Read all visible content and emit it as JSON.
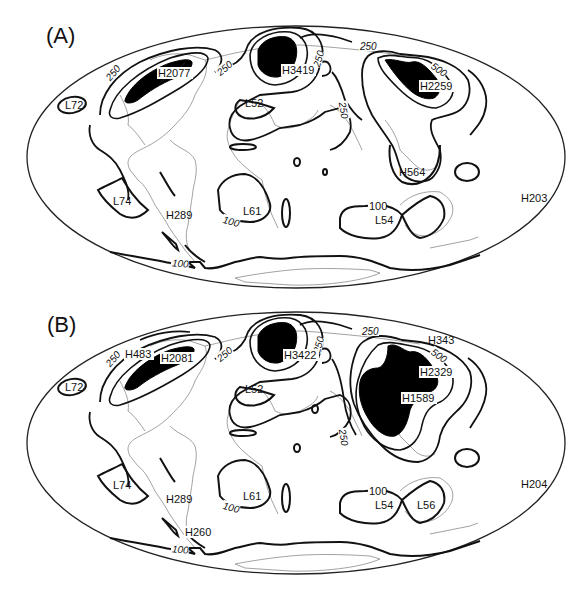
{
  "figure": {
    "type": "global contour maps (Mollweide-like projection)",
    "panels": [
      {
        "id": "A",
        "label": "(A)",
        "contour_labels": [
          "250",
          "250",
          "250",
          "250",
          "500",
          "250",
          "100",
          "100",
          "100"
        ],
        "highs": [
          "H2077",
          "H3419",
          "H2259",
          "H289",
          "H564",
          "H203"
        ],
        "lows": [
          "L72",
          "L52",
          "L74",
          "L61",
          "L54"
        ]
      },
      {
        "id": "B",
        "label": "(B)",
        "contour_labels": [
          "250",
          "250",
          "250",
          "250",
          "500",
          "250",
          "100",
          "100",
          "100"
        ],
        "highs": [
          "H483",
          "H2081",
          "H3422",
          "H343",
          "H2329",
          "H1589",
          "H289",
          "H260",
          "H204"
        ],
        "lows": [
          "L72",
          "L52",
          "L74",
          "L61",
          "L54",
          "L56"
        ]
      }
    ]
  },
  "A": {
    "title": "(A)",
    "c250a": "250",
    "c250b": "250",
    "c250c": "250",
    "c250d": "250",
    "c250e": "250",
    "c500": "500",
    "c100a": "100",
    "c100b": "100",
    "c100c": "100",
    "H2077": "H2077",
    "H3419": "H3419",
    "H2259": "H2259",
    "H289": "H289",
    "H564": "H564",
    "H203": "H203",
    "L72": "L72",
    "L52": "L52",
    "L74": "L74",
    "L61": "L61",
    "L54": "L54"
  },
  "B": {
    "title": "(B)",
    "c250a": "250",
    "c250b": "250",
    "c250c": "250",
    "c250d": "250",
    "c250e": "250",
    "c500": "500",
    "c100a": "100",
    "c100b": "100",
    "c100c": "100",
    "H483": "H483",
    "H2081": "H2081",
    "H3422": "H3422",
    "H343": "H343",
    "H2329": "H2329",
    "H1589": "H1589",
    "H289": "H289",
    "H260": "H260",
    "H204": "H204",
    "L72": "L72",
    "L52": "L52",
    "L74": "L74",
    "L61": "L61",
    "L54": "L54",
    "L56": "L56"
  }
}
